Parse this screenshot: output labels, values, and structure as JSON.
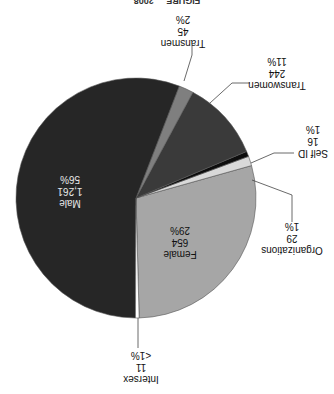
{
  "figure": {
    "orientation": "rotated 180 degrees",
    "title_partial": "FIGURE ... 2008"
  },
  "chart_data": {
    "type": "pie",
    "title": "",
    "total": 2260,
    "slices": [
      {
        "name": "Female",
        "value": 654,
        "pct_label": "29%",
        "value_label": "654",
        "color": "#a6a6a6",
        "label_inside": true
      },
      {
        "name": "Organizations",
        "value": 29,
        "pct_label": "1%",
        "value_label": "29",
        "color": "#d9d9d9",
        "label_inside": false
      },
      {
        "name": "Self ID",
        "value": 16,
        "pct_label": "1%",
        "value_label": "16",
        "color": "#0d0d0d",
        "label_inside": false
      },
      {
        "name": "Transwomen",
        "value": 244,
        "pct_label": "11%",
        "value_label": "244",
        "color": "#3a3a3a",
        "label_inside": false
      },
      {
        "name": "Transmen",
        "value": 45,
        "pct_label": "2%",
        "value_label": "45",
        "color": "#7f7f7f",
        "label_inside": false
      },
      {
        "name": "Male",
        "value": 1261,
        "pct_label": "56%",
        "value_label": "1,261",
        "color": "#262626",
        "label_inside": true
      },
      {
        "name": "Intersex",
        "value": 11,
        "pct_label": "<1%",
        "value_label": "11",
        "color": "#ffffff",
        "label_inside": false
      }
    ]
  },
  "labels": {
    "female": {
      "name": "Female",
      "value": "654",
      "pct": "29%"
    },
    "organizations": {
      "name": "Organizations",
      "value": "29",
      "pct": "1%"
    },
    "self_id": {
      "name": "Self ID",
      "value": "16",
      "pct": "1%"
    },
    "transwomen": {
      "name": "Transwomen",
      "value": "244",
      "pct": "11%"
    },
    "transmen": {
      "name": "Transmen",
      "value": "45",
      "pct": "2%"
    },
    "male": {
      "name": "Male",
      "value": "1,261",
      "pct": "56%"
    },
    "intersex": {
      "name": "Intersex",
      "value": "11",
      "pct": "<1%"
    }
  }
}
